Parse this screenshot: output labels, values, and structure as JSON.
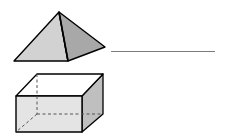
{
  "page": {
    "background_color": "#ffffff",
    "width": 225,
    "height": 140
  },
  "worksheet": {
    "name": "identify-solid-figures",
    "items": [
      {
        "id": "pyramid",
        "shape_name": "square-pyramid",
        "answer_value": "",
        "answer_placeholder": "",
        "line_color": "#7b7b7b",
        "faces": {
          "left_face_color": "#d2d2d2",
          "right_face_color": "#a8a8a8",
          "front_face_color": "#c2c2c2",
          "outline_color": "#000000",
          "hidden_edge_color": "#555555"
        }
      },
      {
        "id": "prism",
        "shape_name": "rectangular-prism",
        "answer_value": "",
        "answer_placeholder": "",
        "line_color": "#7b7b7b",
        "faces": {
          "top_face_color": "#ffffff",
          "front_face_color": "#e4e4e4",
          "right_face_color": "#bfbfbf",
          "left_face_color": "#d6d6d6",
          "outline_color": "#000000",
          "hidden_edge_color": "#555555"
        }
      }
    ]
  }
}
